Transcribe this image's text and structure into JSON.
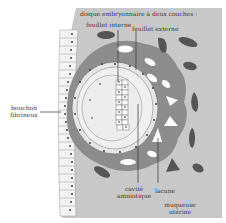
{
  "diagram": {
    "title_label": "disque embryonnaire à deux couches :",
    "labels": {
      "feuillet_interne": "feuillet interne",
      "feuillet_externe": "feuillet externe",
      "bouchon_line1": "bouchon",
      "bouchon_line2": "fibrineux",
      "cavite_line1": "cavité",
      "cavite_line2": "amniotique",
      "lacune": "lacune",
      "muqueuse_line1": "muqueuse",
      "muqueuse_line2": "utérine"
    },
    "colors": {
      "background": "#ffffff",
      "mucosa": "#c8c8c8",
      "trophoblast": "#8c8c8c",
      "dark_blobs": "#555555",
      "lacunae": "#ffffff",
      "epithelium": "#f2f2f2",
      "cells_outline": "#777777",
      "leader_lines": "#333333"
    }
  }
}
